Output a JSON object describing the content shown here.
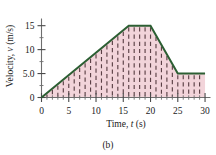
{
  "figure": {
    "panel_label": "(b)"
  },
  "chart_data": {
    "type": "area",
    "title": "",
    "subtitle": "",
    "xlabel": "Time, t (s)",
    "ylabel": "Velocity, v (m/s)",
    "xlabel_parts": {
      "lead": "Time, ",
      "symbol": "t",
      "unit": " (s)"
    },
    "ylabel_parts": {
      "lead": "Velocity, ",
      "symbol": "v",
      "unit": " (m/s)"
    },
    "xlim": [
      0,
      31
    ],
    "ylim": [
      0,
      16.5
    ],
    "xticks": [
      0,
      5,
      10,
      15,
      20,
      25,
      30
    ],
    "xticklabels": [
      "0",
      "5",
      "10",
      "15",
      "20",
      "25",
      "30"
    ],
    "yticks": [
      0,
      5,
      10,
      15
    ],
    "yticklabels": [
      "0",
      "5.0",
      "10",
      "15"
    ],
    "x_minor_step": 1,
    "y_minor_step": 2.5,
    "grid": false,
    "legend": "none",
    "series": [
      {
        "name": "velocity",
        "line_color": "#2c5f33",
        "fill_color": "#f2d4da",
        "hatch": "vertical-dashed",
        "hatch_color": "#5b4046",
        "x": [
          0,
          16,
          20,
          25,
          30
        ],
        "y": [
          0,
          15,
          15,
          5,
          5
        ],
        "description": "Linear acceleration 0 to 15 m/s over 16 s, constant 15 m/s to 20 s, deceleration to 5.0 m/s at 25 s, constant 5.0 m/s to 30 s"
      }
    ],
    "annotations": []
  }
}
